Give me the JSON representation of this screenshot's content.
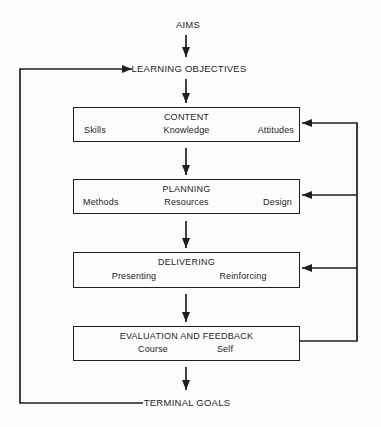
{
  "diagram": {
    "nodes": {
      "aims": "AIMS",
      "learning_objectives": "LEARNING OBJECTIVES",
      "terminal_goals": "TERMINAL GOALS"
    },
    "boxes": [
      {
        "title": "CONTENT",
        "labels": [
          "Skills",
          "Knowledge",
          "Attitudes"
        ]
      },
      {
        "title": "PLANNING",
        "labels": [
          "Methods",
          "Resources",
          "Design"
        ]
      },
      {
        "title": "DELIVERING",
        "labels": [
          "Presenting",
          "Reinforcing"
        ]
      },
      {
        "title": "EVALUATION AND FEEDBACK",
        "labels": [
          "Course",
          "Self"
        ]
      }
    ],
    "colors": {
      "line": "#1e1e1e",
      "text": "#1e1e1e",
      "background": "#fcfcfc"
    }
  }
}
